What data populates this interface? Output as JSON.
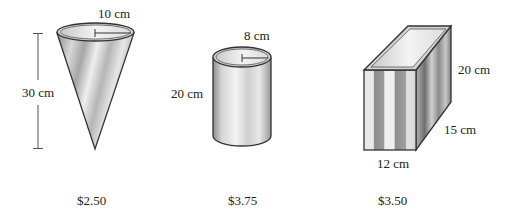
{
  "figures": [
    {
      "shape": "cone",
      "radius_label": "10 cm",
      "height_label": "30 cm",
      "price": "$2.50"
    },
    {
      "shape": "cylinder",
      "radius_label": "8 cm",
      "height_label": "20 cm",
      "price": "$3.75"
    },
    {
      "shape": "rectangular-prism",
      "height_label": "20 cm",
      "depth_label": "15 cm",
      "width_label": "12 cm",
      "price": "$3.50"
    }
  ],
  "colors": {
    "outline": "#333333",
    "light": "#f2f2f2",
    "mid": "#bdbdbd",
    "dark": "#7a7a7a"
  }
}
